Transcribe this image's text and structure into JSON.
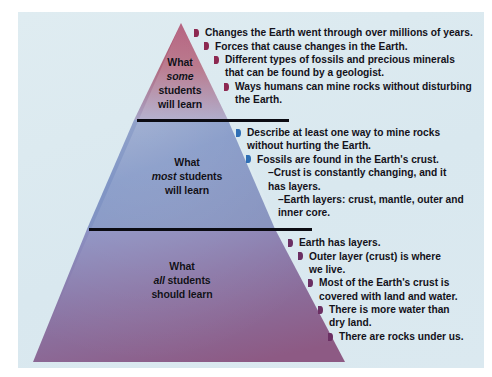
{
  "figure": {
    "background_color": "#dceaf0",
    "page_color": "#ffffff"
  },
  "pyramid": {
    "apex": {
      "x": 181,
      "y": 23
    },
    "base": {
      "left_x": 33,
      "right_x": 345,
      "y": 362
    },
    "tiers": [
      {
        "id": "some",
        "label_line_1": "What",
        "label_line_2": "some",
        "label_line_3": "students",
        "label_line_4": "will learn",
        "label_emphasis": "some",
        "fill_top": "#b35a79",
        "fill_bottom": "#a9a2c4",
        "bullet_color": "#8d2951",
        "divider_color": "#0b0b12"
      },
      {
        "id": "most",
        "label_line_1": "What",
        "label_line_2": "most",
        "label_line_3": "students",
        "label_line_4": "will learn",
        "label_emphasis": "most",
        "fill_top": "#8d9cc4",
        "fill_bottom": "#7f93c0",
        "bullet_color": "#2f6fb5",
        "divider_color": "#0b0b12"
      },
      {
        "id": "all",
        "label_line_1": "What",
        "label_line_2": "all",
        "label_line_3": "students",
        "label_line_4": "should learn",
        "label_emphasis": "all",
        "fill_top": "#8a8fc0",
        "fill_bottom": "#8e5b86",
        "bullet_color": "#6b2f63",
        "divider_color": "#0b0b12"
      }
    ]
  },
  "lists": {
    "some": {
      "bullet_color": "#8d2951",
      "items": [
        {
          "text": "Changes the Earth went through over millions of years.",
          "continuation": "",
          "indent": 0
        },
        {
          "text": "Forces that cause changes in the Earth.",
          "continuation": "",
          "indent": 1
        },
        {
          "text": "Different types of fossils and precious minerals",
          "continuation": "that can be found by a geologist.",
          "indent": 2
        },
        {
          "text": "Ways humans can mine rocks without disturbing",
          "continuation": "the Earth.",
          "indent": 3
        }
      ]
    },
    "most": {
      "bullet_color": "#2f6fb5",
      "items": [
        {
          "text": "Describe at least one way to mine rocks",
          "continuation": "without hurting the Earth.",
          "indent": 0
        },
        {
          "text": "Fossils are found in the Earth's crust.",
          "continuation": "",
          "indent": 1
        }
      ],
      "sub_items": [
        {
          "text": "–Crust is constantly changing, and it",
          "continuation": "has layers.",
          "indent": 1
        },
        {
          "text": "–Earth layers: crust, mantle, outer and",
          "continuation": "inner core.",
          "indent": 2
        }
      ]
    },
    "all": {
      "bullet_color": "#6b2f63",
      "items": [
        {
          "text": "Earth has layers.",
          "continuation": "",
          "indent": 0
        },
        {
          "text": "Outer layer (crust) is where",
          "continuation": "we live.",
          "indent": 1
        },
        {
          "text": "Most of the Earth's crust is",
          "continuation": "covered with land and water.",
          "indent": 2
        },
        {
          "text": "There is more water than",
          "continuation": "dry land.",
          "indent": 3
        },
        {
          "text": "There are rocks under us.",
          "continuation": "",
          "indent": 4
        }
      ]
    }
  }
}
